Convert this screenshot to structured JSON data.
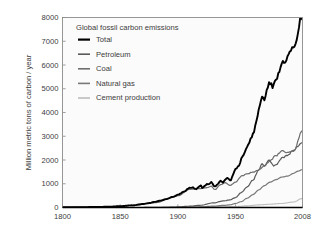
{
  "figure": {
    "background_color": "#ffffff",
    "plot_background_color": "#fbfbfb",
    "frame_color": "#8c8c8c",
    "text_color": "#3c3c3c"
  },
  "chart_data": {
    "type": "line",
    "title": "Global fossil carbon emissions",
    "xlabel": "",
    "ylabel": "Million metric tons of carbon / year",
    "xlim": [
      1800,
      2008
    ],
    "ylim": [
      0,
      8000
    ],
    "grid": false,
    "legend_position": "top-left",
    "xticks": [
      1800,
      1850,
      1900,
      1950,
      2008
    ],
    "xtick_labels": [
      "1800",
      "1850",
      "1900",
      "1950",
      "2008"
    ],
    "yticks": [
      0,
      1000,
      2000,
      3000,
      4000,
      5000,
      6000,
      7000,
      8000
    ],
    "ytick_labels": [
      "0",
      "1000",
      "2000",
      "3000",
      "4000",
      "5000",
      "6000",
      "7000",
      "8000"
    ],
    "series": [
      {
        "name": "Total",
        "color": "#000000",
        "width": 1.9,
        "x": [
          1800,
          1810,
          1820,
          1830,
          1840,
          1850,
          1860,
          1870,
          1875,
          1880,
          1885,
          1890,
          1895,
          1900,
          1905,
          1910,
          1913,
          1916,
          1918,
          1920,
          1921,
          1923,
          1925,
          1927,
          1929,
          1932,
          1934,
          1937,
          1939,
          1941,
          1943,
          1945,
          1946,
          1948,
          1950,
          1953,
          1955,
          1958,
          1960,
          1963,
          1965,
          1968,
          1970,
          1973,
          1974,
          1975,
          1977,
          1979,
          1980,
          1982,
          1983,
          1985,
          1987,
          1989,
          1991,
          1992,
          1994,
          1996,
          1998,
          2000,
          2002,
          2004,
          2006,
          2008
        ],
        "y": [
          8,
          12,
          17,
          24,
          33,
          54,
          91,
          147,
          187,
          236,
          292,
          357,
          435,
          534,
          663,
          819,
          843,
          770,
          860,
          936,
          816,
          896,
          975,
          980,
          1060,
          880,
          960,
          1120,
          1060,
          1180,
          1250,
          1150,
          1160,
          1420,
          1630,
          1770,
          2050,
          2320,
          2570,
          2860,
          3090,
          3590,
          4080,
          4640,
          4600,
          4550,
          4880,
          5330,
          5260,
          5090,
          5100,
          5380,
          5600,
          5940,
          6100,
          6080,
          6240,
          6470,
          6610,
          6770,
          6840,
          7370,
          7910,
          7910
        ],
        "note": "Sum of petroleum, coal, natural gas, cement and flaring"
      },
      {
        "name": "Petroleum",
        "color": "#5a5a5a",
        "width": 1.2,
        "x": [
          1870,
          1880,
          1890,
          1900,
          1910,
          1920,
          1930,
          1940,
          1945,
          1950,
          1955,
          1960,
          1965,
          1970,
          1973,
          1975,
          1979,
          1980,
          1983,
          1985,
          1990,
          1995,
          2000,
          2004,
          2008
        ],
        "y": [
          1,
          4,
          10,
          23,
          55,
          95,
          190,
          280,
          320,
          420,
          630,
          860,
          1150,
          1570,
          1850,
          1760,
          2000,
          1940,
          1760,
          1800,
          2080,
          2200,
          2400,
          2570,
          2740
        ]
      },
      {
        "name": "Coal",
        "color": "#6e6e6e",
        "width": 1.2,
        "x": [
          1800,
          1820,
          1840,
          1860,
          1880,
          1900,
          1910,
          1913,
          1918,
          1920,
          1925,
          1929,
          1932,
          1937,
          1941,
          1945,
          1950,
          1955,
          1960,
          1965,
          1970,
          1975,
          1980,
          1985,
          1990,
          1995,
          2000,
          2002,
          2004,
          2006,
          2008
        ],
        "y": [
          8,
          16,
          30,
          78,
          200,
          490,
          760,
          780,
          790,
          800,
          830,
          890,
          750,
          960,
          1050,
          930,
          1070,
          1320,
          1420,
          1490,
          1570,
          1750,
          1980,
          2180,
          2380,
          2320,
          2370,
          2450,
          2830,
          3080,
          3250
        ]
      },
      {
        "name": "Natural gas",
        "color": "#787878",
        "width": 1.2,
        "x": [
          1885,
          1900,
          1910,
          1920,
          1930,
          1940,
          1945,
          1950,
          1955,
          1960,
          1965,
          1970,
          1975,
          1980,
          1985,
          1990,
          1995,
          2000,
          2004,
          2008
        ],
        "y": [
          1,
          3,
          10,
          25,
          55,
          90,
          110,
          170,
          250,
          390,
          540,
          740,
          920,
          1070,
          1170,
          1280,
          1320,
          1430,
          1530,
          1600
        ]
      },
      {
        "name": "Cement production",
        "color": "#bdbdbd",
        "width": 1.1,
        "x": [
          1900,
          1920,
          1940,
          1950,
          1960,
          1970,
          1980,
          1990,
          2000,
          2008
        ],
        "y": [
          5,
          18,
          30,
          40,
          70,
          110,
          140,
          170,
          230,
          380
        ]
      }
    ],
    "legend_entries": [
      {
        "label": "Total",
        "color": "#000000",
        "width": 2.2
      },
      {
        "label": "Petroleum",
        "color": "#5a5a5a",
        "width": 1.6
      },
      {
        "label": "Coal",
        "color": "#6e6e6e",
        "width": 1.6
      },
      {
        "label": "Natural gas",
        "color": "#787878",
        "width": 1.6
      },
      {
        "label": "Cement production",
        "color": "#bdbdbd",
        "width": 1.6
      }
    ]
  }
}
